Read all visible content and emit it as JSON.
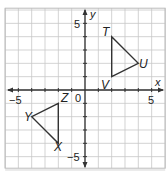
{
  "diagram": {
    "type": "coordinate-plane",
    "axes": {
      "x_label": "x",
      "y_label": "y",
      "origin_label": "0",
      "x_ticks": {
        "neg": "−5",
        "pos": "5"
      },
      "y_ticks": {
        "neg": "−5",
        "pos": "5"
      },
      "range": [
        -6,
        6
      ]
    },
    "colors": {
      "grid": "#c8c8c8",
      "axis": "#333333",
      "shape": "#333333",
      "border": "#bbbbbb"
    },
    "triangles": [
      {
        "name": "TUV",
        "vertices": [
          {
            "label": "T",
            "x": 2,
            "y": 4
          },
          {
            "label": "U",
            "x": 4,
            "y": 2
          },
          {
            "label": "V",
            "x": 2,
            "y": 1
          }
        ]
      },
      {
        "name": "XYZ",
        "vertices": [
          {
            "label": "Z",
            "x": -2,
            "y": -1
          },
          {
            "label": "Y",
            "x": -4,
            "y": -2
          },
          {
            "label": "X",
            "x": -2,
            "y": -4
          }
        ]
      }
    ]
  }
}
